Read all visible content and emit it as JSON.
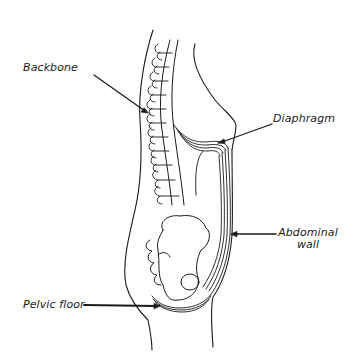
{
  "figure": {
    "type": "anatomical-diagram",
    "colors": {
      "line": "#1a1a1a",
      "background": "#ffffff"
    }
  },
  "labels": {
    "backbone": "Backbone",
    "diaphragm": "Diaphragm",
    "abdominal_wall_line1": "Abdominal",
    "abdominal_wall_line2": "wall",
    "pelvic_floor": "Pelvic floor"
  }
}
